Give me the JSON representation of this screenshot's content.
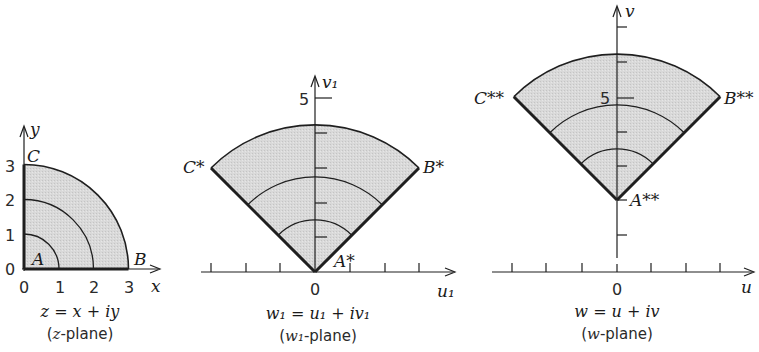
{
  "colors": {
    "region_fill": "#d6d6d6",
    "stroke": "#1f1f1f",
    "background": "#ffffff"
  },
  "panels": [
    {
      "id": "z-plane",
      "caption": "z = x + iy",
      "subcaption_prefix": "(",
      "subcaption_var": "z",
      "subcaption_suffix": "-plane)",
      "axis_x_label": "x",
      "axis_y_label": "y",
      "x_tick_labels": [
        "0",
        "1",
        "2",
        "3"
      ],
      "y_tick_labels": [
        "0",
        "1",
        "2",
        "3"
      ],
      "points": [
        {
          "label": "A",
          "desc": "origin"
        },
        {
          "label": "B",
          "desc": "z = 3"
        },
        {
          "label": "C",
          "desc": "z = 3i"
        }
      ],
      "arc_radii": [
        1,
        2,
        3
      ]
    },
    {
      "id": "w1-plane",
      "caption": "w₁ = u₁ + iv₁",
      "subcaption_prefix": "(",
      "subcaption_var": "w₁",
      "subcaption_suffix": "-plane)",
      "axis_x_label": "u₁",
      "axis_y_label": "v₁",
      "origin_label": "0",
      "y_tick_label_shown": "5",
      "points": [
        {
          "label": "A*"
        },
        {
          "label": "B*"
        },
        {
          "label": "C*"
        }
      ]
    },
    {
      "id": "w-plane",
      "caption": "w = u + iv",
      "subcaption_prefix": "(",
      "subcaption_var": "w",
      "subcaption_suffix": "-plane)",
      "axis_x_label": "u",
      "axis_y_label": "v",
      "origin_label": "0",
      "y_tick_label_shown": "5",
      "points": [
        {
          "label": "A**"
        },
        {
          "label": "B**"
        },
        {
          "label": "C**"
        }
      ]
    }
  ]
}
